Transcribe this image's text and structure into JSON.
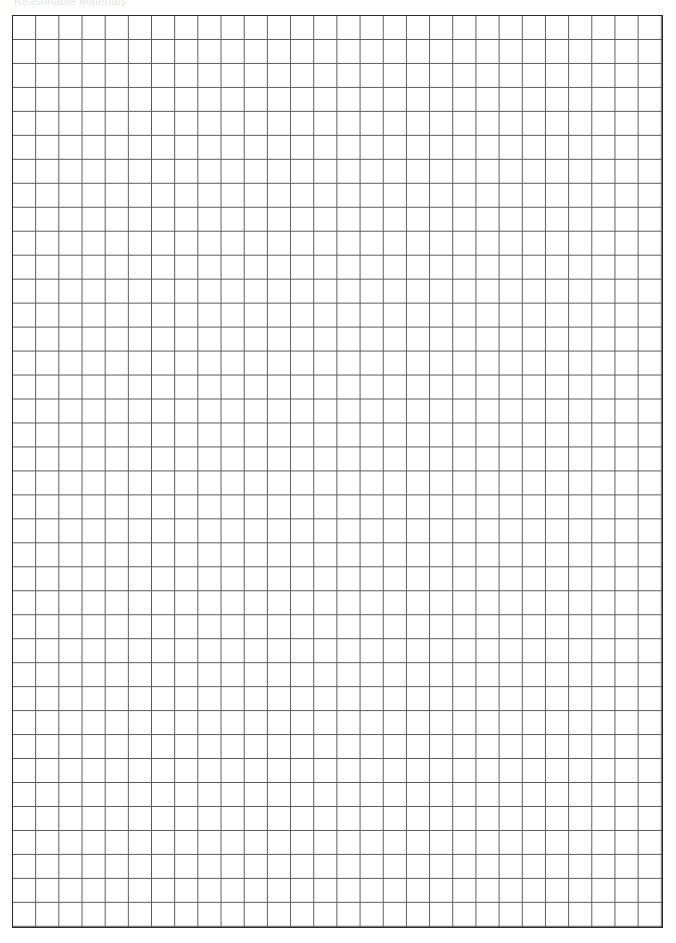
{
  "page": {
    "header_text": "Reasonable Materials"
  },
  "grid": {
    "columns": 28,
    "rows": 38,
    "line_color": "#5a5a5a",
    "border_color": "#2a2a2a",
    "background_color": "#ffffff"
  }
}
